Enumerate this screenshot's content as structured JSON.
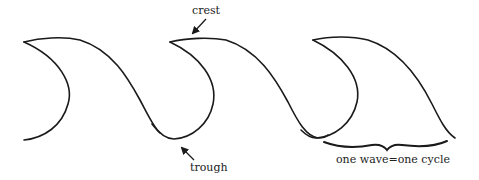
{
  "diagram": {
    "title": "",
    "labels": {
      "crest": "crest",
      "trough": "trough",
      "cycle": "one wave=one cycle"
    },
    "waves": [
      {
        "id": 1,
        "tip": [
          24,
          42
        ],
        "crest": [
          60,
          38
        ],
        "end": [
          160,
          132
        ]
      },
      {
        "id": 2,
        "tip": [
          170,
          42
        ],
        "crest": [
          205,
          38
        ],
        "trough": [
          178,
          139
        ],
        "end": [
          318,
          138
        ]
      },
      {
        "id": 3,
        "tip": [
          313,
          40
        ],
        "crest": [
          350,
          38
        ],
        "end": [
          455,
          138
        ]
      }
    ],
    "colors": {
      "stroke": "#1a1a1a",
      "text": "#222222",
      "background": "#ffffff"
    }
  }
}
